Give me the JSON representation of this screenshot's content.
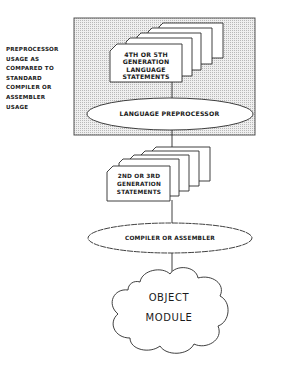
{
  "diagram": {
    "side_note": {
      "lines": [
        "PREPROCESSOR",
        "USAGE AS",
        "COMPARED TO",
        "STANDARD",
        "COMPILER OR",
        "ASSEMBLER",
        "USAGE"
      ]
    },
    "shaded_region": {
      "description": "preprocessor stage"
    },
    "nodes": {
      "source_stack": {
        "shape": "document-stack",
        "lines": [
          "4TH OR 5TH",
          "GENERATION",
          "LANGUAGE",
          "STATEMENTS"
        ]
      },
      "preprocessor": {
        "shape": "ellipse",
        "label": "LANGUAGE PREPROCESSOR"
      },
      "intermediate_stack": {
        "shape": "document-stack",
        "lines": [
          "2ND OR 3RD",
          "GENERATION",
          "STATEMENTS"
        ]
      },
      "compiler": {
        "shape": "ellipse",
        "label": "COMPILER OR ASSEMBLER"
      },
      "output": {
        "shape": "cloud",
        "lines": [
          "OBJECT",
          "MODULE"
        ]
      }
    },
    "edges": [
      {
        "from": "source_stack",
        "to": "preprocessor"
      },
      {
        "from": "preprocessor",
        "to": "intermediate_stack"
      },
      {
        "from": "intermediate_stack",
        "to": "compiler"
      },
      {
        "from": "compiler",
        "to": "output"
      }
    ],
    "colors": {
      "line": "#2a2a2a",
      "shade": "#d9d9d9",
      "paper": "#ffffff"
    }
  }
}
